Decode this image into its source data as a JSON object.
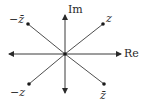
{
  "diagram": {
    "axes": {
      "real_label": "Re",
      "imag_label": "Im"
    },
    "points": [
      {
        "name": "z",
        "label": "z",
        "quadrant": "I"
      },
      {
        "name": "neg-conj-z",
        "label": "−z̄",
        "quadrant": "II"
      },
      {
        "name": "neg-z",
        "label": "−z",
        "quadrant": "III"
      },
      {
        "name": "conj-z",
        "label": "z̄",
        "quadrant": "IV"
      }
    ],
    "colors": {
      "line": "#3a3a3a",
      "point": "#1a1a1a",
      "text": "#2a2a2a"
    }
  }
}
